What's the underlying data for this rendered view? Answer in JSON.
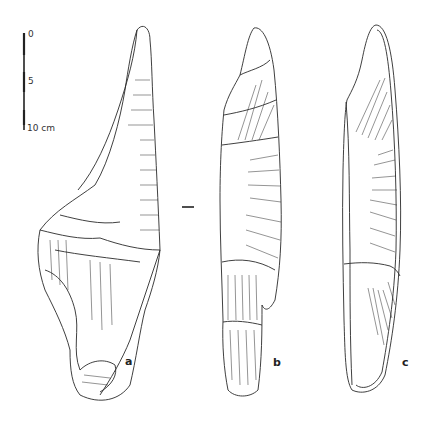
{
  "figure": {
    "scale_bar": {
      "ticks": [
        "0",
        "5",
        "10 cm"
      ]
    },
    "views": [
      {
        "id": "a",
        "label": "a"
      },
      {
        "id": "b",
        "label": "b"
      },
      {
        "id": "c",
        "label": "c"
      }
    ],
    "colors": {
      "ink": "#2a2a2a",
      "background": "#ffffff"
    }
  }
}
